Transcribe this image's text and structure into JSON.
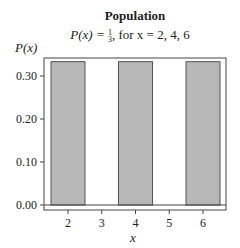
{
  "chart_data": {
    "type": "bar",
    "title": "Population",
    "subtitle": "P(x) = 1/3, for x = 2, 4, 6",
    "xlabel": "x",
    "ylabel": "P(x)",
    "categories": [
      2,
      4,
      6
    ],
    "values": [
      0.3333,
      0.3333,
      0.3333
    ],
    "x_ticks": [
      "2",
      "3",
      "4",
      "5",
      "6"
    ],
    "y_ticks": [
      "0.00",
      "0.10",
      "0.20",
      "0.30"
    ],
    "ylim": [
      0,
      0.35
    ],
    "xlim": [
      1.3,
      6.7
    ],
    "grid": false,
    "legend": null,
    "bar_color": "#b8b8b8",
    "bar_edge_color": "#555555"
  },
  "labels": {
    "title": "Population",
    "subtitle_prefix": "P(x) = ",
    "frac_num": "1",
    "frac_den": "3",
    "subtitle_suffix": ", for x = 2, 4, 6",
    "ylabel": "P(x)",
    "xlabel": "x"
  }
}
